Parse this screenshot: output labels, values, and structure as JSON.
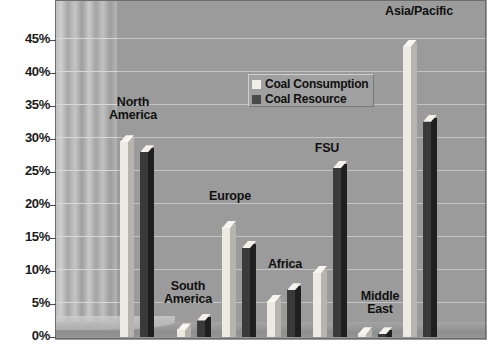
{
  "chart_data": {
    "type": "bar",
    "title": "",
    "xlabel": "",
    "ylabel": "",
    "ylim": [
      0,
      45
    ],
    "grid": true,
    "legend_position": "inside-top-center",
    "categories": [
      "North America",
      "South America",
      "Europe",
      "Africa",
      "FSU",
      "Middle East",
      "Asia/Pacific"
    ],
    "ytick_labels": [
      "0%",
      "5%",
      "10%",
      "15%",
      "20%",
      "25%",
      "30%",
      "35%",
      "40%",
      "45%"
    ],
    "ytick_values": [
      0,
      5,
      10,
      15,
      20,
      25,
      30,
      35,
      40,
      45
    ],
    "series": [
      {
        "name": "Coal Consumption",
        "color": "#efeee8",
        "values": [
          29.5,
          1.0,
          16.5,
          5.3,
          9.7,
          0.4,
          44.0
        ]
      },
      {
        "name": "Coal Resource",
        "color": "#3a3a3a",
        "values": [
          28.0,
          2.5,
          13.5,
          7.1,
          25.6,
          0.4,
          32.6
        ]
      }
    ]
  },
  "legend": {
    "items": [
      {
        "label": "Coal Consumption",
        "swatch": "light"
      },
      {
        "label": "Coal Resource",
        "swatch": "dark"
      }
    ]
  },
  "group_labels": [
    {
      "text": "North\nAmerica",
      "left": 100,
      "top": 96,
      "width": 66
    },
    {
      "text": "South\nAmerica",
      "left": 157,
      "top": 280,
      "width": 62
    },
    {
      "text": "Europe",
      "left": 200,
      "top": 190,
      "width": 60
    },
    {
      "text": "Africa",
      "left": 258,
      "top": 258,
      "width": 54
    },
    {
      "text": "FSU",
      "left": 305,
      "top": 142,
      "width": 44
    },
    {
      "text": "Middle\nEast",
      "left": 353,
      "top": 290,
      "width": 54
    },
    {
      "text": "Asia/Pacific",
      "left": 373,
      "top": 5,
      "width": 92
    }
  ],
  "colors": {
    "plot_background": "#9b9b9b",
    "gridline": "#c4c4c4",
    "axis_text": "#1a1a1a",
    "series_light": "#efeee8",
    "series_dark": "#3a3a3a"
  }
}
